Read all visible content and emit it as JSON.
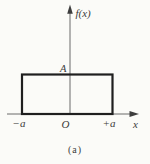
{
  "figure": {
    "caption": "(a)",
    "y_axis_label": "f(x)",
    "x_axis_label": "x",
    "amplitude_label": "A",
    "tick_labels": {
      "neg": "−a",
      "origin": "O",
      "pos": "+a"
    },
    "shape": {
      "type": "rectangular-pulse",
      "x_from": "−a",
      "x_to": "+a",
      "height": "A"
    },
    "colors": {
      "background": "#fbfbf8",
      "axis": "#6b6b6b",
      "arrow": "#3d3d3d",
      "pulse_outline": "#1f1f1f",
      "text": "#3b3b3b"
    }
  }
}
